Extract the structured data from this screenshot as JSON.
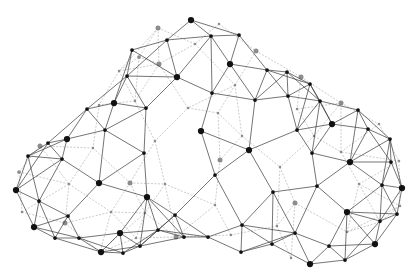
{
  "illustration": {
    "subject": "wireframe-cloud",
    "background": "#ffffff",
    "colors": {
      "front_edge": "#3a3a3a",
      "back_edge": "#b5b5b5",
      "front_node": "#111111",
      "back_node": "#8c8c8c"
    },
    "front_nodes": [
      [
        191,
        20
      ],
      [
        211,
        36
      ],
      [
        239,
        35
      ],
      [
        167,
        40
      ],
      [
        132,
        50
      ],
      [
        230,
        64
      ],
      [
        177,
        77
      ],
      [
        127,
        76
      ],
      [
        267,
        70
      ],
      [
        287,
        72
      ],
      [
        310,
        84
      ],
      [
        212,
        93
      ],
      [
        288,
        96
      ],
      [
        255,
        100
      ],
      [
        114,
        103
      ],
      [
        320,
        101
      ],
      [
        87,
        109
      ],
      [
        146,
        108
      ],
      [
        358,
        110
      ],
      [
        332,
        124
      ],
      [
        105,
        130
      ],
      [
        201,
        131
      ],
      [
        297,
        130
      ],
      [
        368,
        129
      ],
      [
        67,
        139
      ],
      [
        48,
        143
      ],
      [
        28,
        156
      ],
      [
        144,
        153
      ],
      [
        249,
        150
      ],
      [
        312,
        153
      ],
      [
        390,
        139
      ],
      [
        62,
        159
      ],
      [
        350,
        162
      ],
      [
        391,
        162
      ],
      [
        215,
        175
      ],
      [
        99,
        183
      ],
      [
        16,
        190
      ],
      [
        317,
        186
      ],
      [
        382,
        185
      ],
      [
        402,
        188
      ],
      [
        273,
        192
      ],
      [
        147,
        197
      ],
      [
        39,
        201
      ],
      [
        68,
        216
      ],
      [
        347,
        212
      ],
      [
        175,
        215
      ],
      [
        380,
        221
      ],
      [
        397,
        214
      ],
      [
        34,
        227
      ],
      [
        242,
        225
      ],
      [
        120,
        233
      ],
      [
        158,
        230
      ],
      [
        208,
        237
      ],
      [
        55,
        238
      ],
      [
        79,
        238
      ],
      [
        295,
        233
      ],
      [
        140,
        246
      ],
      [
        272,
        244
      ],
      [
        329,
        246
      ],
      [
        375,
        244
      ],
      [
        101,
        252
      ],
      [
        123,
        253
      ],
      [
        241,
        252
      ],
      [
        310,
        264
      ],
      [
        345,
        260
      ],
      [
        184,
        237
      ]
    ],
    "front_node_sizes": [
      5,
      3,
      3,
      3,
      3,
      5,
      5,
      3,
      3,
      3,
      3,
      3,
      3,
      3,
      5,
      3,
      3,
      3,
      3,
      5,
      3,
      5,
      3,
      3,
      5,
      3,
      3,
      3,
      5,
      3,
      3,
      3,
      5,
      3,
      3,
      5,
      5,
      3,
      3,
      5,
      3,
      5,
      3,
      3,
      5,
      3,
      3,
      3,
      5,
      3,
      5,
      3,
      3,
      3,
      3,
      3,
      3,
      3,
      3,
      5,
      5,
      3,
      3,
      5,
      3,
      3
    ],
    "back_nodes": [
      [
        158,
        28
      ],
      [
        219,
        24
      ],
      [
        195,
        44
      ],
      [
        139,
        57
      ],
      [
        119,
        71
      ],
      [
        159,
        64
      ],
      [
        256,
        51
      ],
      [
        301,
        77
      ],
      [
        235,
        85
      ],
      [
        135,
        101
      ],
      [
        99,
        105
      ],
      [
        188,
        108
      ],
      [
        341,
        103
      ],
      [
        297,
        109
      ],
      [
        218,
        113
      ],
      [
        379,
        124
      ],
      [
        155,
        141
      ],
      [
        93,
        148
      ],
      [
        242,
        136
      ],
      [
        314,
        136
      ],
      [
        220,
        160
      ],
      [
        341,
        152
      ],
      [
        40,
        146
      ],
      [
        280,
        167
      ],
      [
        19,
        172
      ],
      [
        69,
        184
      ],
      [
        130,
        183
      ],
      [
        165,
        184
      ],
      [
        359,
        184
      ],
      [
        399,
        161
      ],
      [
        295,
        203
      ],
      [
        215,
        205
      ],
      [
        111,
        212
      ],
      [
        145,
        213
      ],
      [
        22,
        212
      ],
      [
        65,
        223
      ],
      [
        400,
        206
      ],
      [
        277,
        226
      ],
      [
        176,
        237
      ],
      [
        231,
        235
      ],
      [
        136,
        238
      ],
      [
        347,
        232
      ],
      [
        291,
        258
      ],
      [
        380,
        222
      ],
      [
        100,
        252
      ]
    ],
    "back_node_sizes": [
      4,
      2,
      2,
      3,
      2,
      4,
      4,
      4,
      2,
      2,
      2,
      2,
      4,
      2,
      2,
      2,
      2,
      2,
      2,
      2,
      4,
      2,
      4,
      2,
      3,
      2,
      4,
      2,
      2,
      2,
      4,
      2,
      2,
      2,
      2,
      4,
      2,
      2,
      4,
      2,
      2,
      2,
      2,
      2,
      2
    ]
  }
}
